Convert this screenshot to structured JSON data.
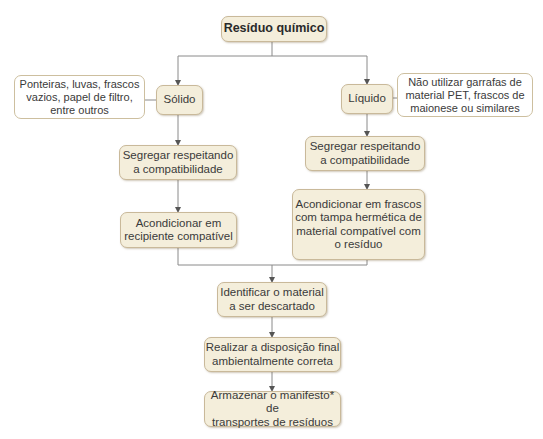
{
  "diagram": {
    "root": "Resíduo químico",
    "solid": {
      "label": "Sólido",
      "note": [
        "Ponteiras, luvas, frascos",
        "vazios, papel de filtro,",
        "entre outros"
      ],
      "steps": [
        [
          "Segregar respeitando",
          "a compatibilidade"
        ],
        [
          "Acondicionar em",
          "recipiente compatível"
        ]
      ]
    },
    "liquid": {
      "label": "Líquido",
      "note": [
        "Não utilizar garrafas de",
        "material PET, frascos de",
        "maionese ou similares"
      ],
      "steps": [
        [
          "Segregar respeitando",
          "a compatibilidade"
        ],
        [
          "Acondicionar em frascos",
          "com tampa hermética de",
          "material compatível com",
          "o resíduo"
        ]
      ]
    },
    "final_steps": [
      [
        "Identificar o material",
        "a ser descartado"
      ],
      [
        "Realizar a disposição final",
        "ambientalmente correta"
      ],
      [
        "Armazenar o manifesto* de",
        "transportes de resíduos"
      ]
    ]
  },
  "colors": {
    "box_fill": "#f4eedb",
    "box_border": "#c9b99a",
    "line": "#888888"
  }
}
